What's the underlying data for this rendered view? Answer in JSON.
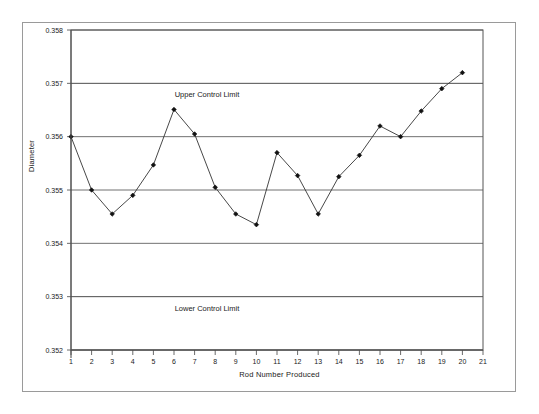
{
  "chart_data": {
    "type": "line",
    "title": "",
    "xlabel": "Rod Number Produced",
    "ylabel": "Diameter",
    "x": [
      1,
      2,
      3,
      4,
      5,
      6,
      7,
      8,
      9,
      10,
      11,
      12,
      13,
      14,
      15,
      16,
      17,
      18,
      19,
      20
    ],
    "values": [
      0.356,
      0.355,
      0.35455,
      0.3549,
      0.35547,
      0.35651,
      0.35605,
      0.35505,
      0.35455,
      0.35435,
      0.3557,
      0.35527,
      0.35455,
      0.35525,
      0.35565,
      0.3562,
      0.356,
      0.35648,
      0.3569,
      0.3572
    ],
    "series": [
      {
        "name": "Diameter",
        "values": [
          0.356,
          0.355,
          0.35455,
          0.3549,
          0.35547,
          0.35651,
          0.35605,
          0.35505,
          0.35455,
          0.35435,
          0.3557,
          0.35527,
          0.35455,
          0.35525,
          0.35565,
          0.3562,
          0.356,
          0.35648,
          0.3569,
          0.3572
        ]
      }
    ],
    "xlim": [
      1,
      21
    ],
    "ylim": [
      0.352,
      0.358
    ],
    "xticks": [
      1,
      2,
      3,
      4,
      5,
      6,
      7,
      8,
      9,
      10,
      11,
      12,
      13,
      14,
      15,
      16,
      17,
      18,
      19,
      20,
      21
    ],
    "xtick_labels": [
      "1",
      "2",
      "3",
      "4",
      "5",
      "6",
      "7",
      "8",
      "9",
      "10",
      "11",
      "12",
      "13",
      "14",
      "15",
      "16",
      "17",
      "18",
      "19",
      "20",
      "21"
    ],
    "yticks": [
      0.352,
      0.353,
      0.354,
      0.355,
      0.356,
      0.357,
      0.358
    ],
    "ytick_labels": [
      "0.352",
      "0.353",
      "0.354",
      "0.355",
      "0.356",
      "0.357",
      "0.358"
    ],
    "grid": true,
    "legend": "none",
    "marker": "diamond",
    "line_color": "#333333",
    "marker_color": "#111111",
    "grid_color": "#4d4d4d",
    "annotations": [
      {
        "name": "upper-control-limit",
        "text": "Upper Control Limit",
        "y": 0.357,
        "x": 7.6
      },
      {
        "name": "lower-control-limit",
        "text": "Lower Control Limit",
        "y": 0.353,
        "x": 7.6
      }
    ],
    "control_limits": {
      "upper": 0.357,
      "lower": 0.353
    }
  }
}
